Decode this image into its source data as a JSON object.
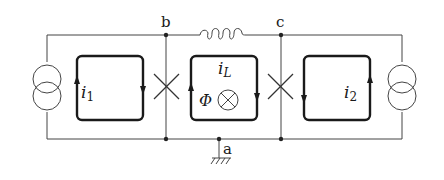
{
  "diagram": {
    "type": "circuit",
    "nodes": {
      "b": "b",
      "c": "c",
      "a": "a"
    },
    "loops": {
      "left": {
        "current": "i",
        "sub": "1"
      },
      "middle": {
        "current": "i",
        "sub": "L",
        "flux": "Φ"
      },
      "right": {
        "current": "i",
        "sub": "2"
      }
    },
    "components": [
      "current-source-left",
      "josephson-junction-b",
      "inductor-bc",
      "josephson-junction-c",
      "current-source-right",
      "ground-a"
    ],
    "colors": {
      "wire": "#333333",
      "loop": "#1a1a1a",
      "background": "#ffffff"
    }
  }
}
